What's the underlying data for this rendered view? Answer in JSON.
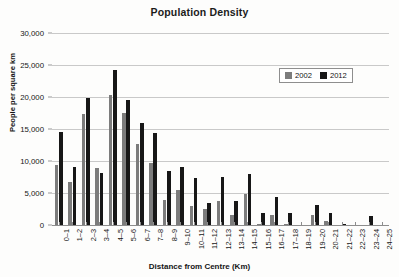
{
  "chart_data": {
    "type": "bar",
    "title": "Population Density",
    "xlabel": "Distance from Centre (Km)",
    "ylabel": "People per square km",
    "ylim": [
      0,
      30000
    ],
    "yticks": [
      0,
      5000,
      10000,
      15000,
      20000,
      25000,
      30000
    ],
    "ytick_labels": [
      "0",
      "5,000",
      "10,000",
      "15,000",
      "20,000",
      "25,000",
      "30,000"
    ],
    "grid": true,
    "legend_position": "top-right",
    "categories": [
      "0–1",
      "1–2",
      "2–3",
      "3–4",
      "4–5",
      "5–6",
      "6–7",
      "7–8",
      "8–9",
      "9–10",
      "10–11",
      "11–12",
      "12–13",
      "13–14",
      "14–15",
      "15–16",
      "16–17",
      "17–18",
      "18–19",
      "19–20",
      "20–21",
      "21–22",
      "22–23",
      "23–24",
      "24–25"
    ],
    "series": [
      {
        "name": "2002",
        "color": "#7c7c7c",
        "values": [
          9400,
          6700,
          17300,
          8900,
          20300,
          17500,
          12600,
          9700,
          3900,
          5500,
          3000,
          2500,
          3700,
          1500,
          4800,
          200,
          1600,
          200,
          0,
          1600,
          600,
          0,
          0,
          0,
          0
        ]
      },
      {
        "name": "2012",
        "color": "#171717",
        "values": [
          14600,
          9100,
          19900,
          8200,
          24200,
          19500,
          15900,
          14300,
          8500,
          9100,
          7300,
          3500,
          7500,
          3700,
          8000,
          1900,
          4400,
          1900,
          0,
          3200,
          1800,
          200,
          0,
          1400,
          0
        ]
      }
    ]
  },
  "legend": {
    "items": [
      {
        "label": "2002",
        "color": "#7c7c7c"
      },
      {
        "label": "2012",
        "color": "#171717"
      }
    ]
  }
}
